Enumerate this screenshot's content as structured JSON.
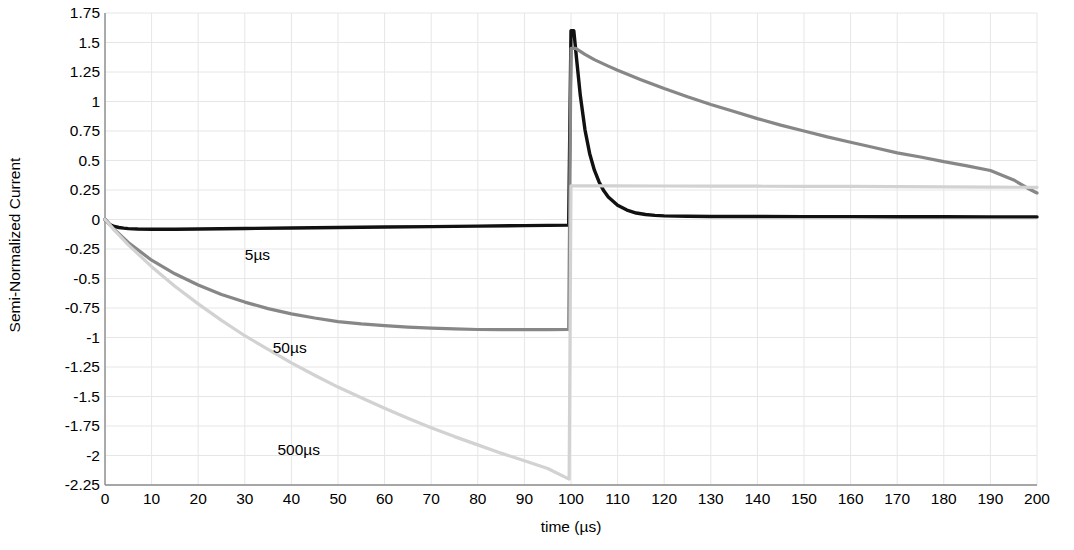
{
  "chart_data": {
    "type": "line",
    "title": "",
    "xlabel": "time (µs)",
    "ylabel": "Semi-Normalized Current",
    "xlim": [
      0,
      200
    ],
    "ylim": [
      -2.25,
      1.75
    ],
    "xticks": [
      0,
      10,
      20,
      30,
      40,
      50,
      60,
      70,
      80,
      90,
      100,
      110,
      120,
      130,
      140,
      150,
      160,
      170,
      180,
      190,
      200
    ],
    "yticks": [
      1.75,
      1.5,
      1.25,
      1,
      0.75,
      0.5,
      0.25,
      0,
      -0.25,
      -0.5,
      -0.75,
      -1,
      -1.25,
      -1.5,
      -1.75,
      -2,
      -2.25
    ],
    "xtick_labels": [
      "0",
      "10",
      "20",
      "30",
      "40",
      "50",
      "60",
      "70",
      "80",
      "90",
      "100",
      "110",
      "120",
      "130",
      "140",
      "150",
      "160",
      "170",
      "180",
      "190",
      "200"
    ],
    "ytick_labels": [
      "1.75",
      "1.5",
      "1.25",
      "1",
      "0.75",
      "0.5",
      "0.25",
      "0",
      "-0.25",
      "-0.5",
      "-0.75",
      "-1",
      "-1.25",
      "-1.5",
      "-1.75",
      "-2",
      "-2.25"
    ],
    "grid": true,
    "grid_color": "#e6e6e6",
    "legend": "inline-annotations",
    "series": [
      {
        "name": "5µs",
        "color": "#111111",
        "width": 3.4,
        "label_x": 30,
        "label_y": -0.3,
        "points": [
          [
            0,
            0
          ],
          [
            1,
            -0.042
          ],
          [
            2,
            -0.059
          ],
          [
            3,
            -0.068
          ],
          [
            4,
            -0.073
          ],
          [
            5,
            -0.077
          ],
          [
            7,
            -0.081
          ],
          [
            10,
            -0.083
          ],
          [
            15,
            -0.082
          ],
          [
            20,
            -0.08
          ],
          [
            30,
            -0.076
          ],
          [
            40,
            -0.072
          ],
          [
            50,
            -0.068
          ],
          [
            60,
            -0.064
          ],
          [
            70,
            -0.06
          ],
          [
            80,
            -0.056
          ],
          [
            90,
            -0.052
          ],
          [
            95,
            -0.05
          ],
          [
            99.5,
            -0.048
          ],
          [
            100,
            1.6
          ],
          [
            100.6,
            1.6
          ],
          [
            101.2,
            1.36
          ],
          [
            102,
            1.05
          ],
          [
            103,
            0.76
          ],
          [
            104,
            0.56
          ],
          [
            105,
            0.42
          ],
          [
            106,
            0.32
          ],
          [
            107,
            0.245
          ],
          [
            108,
            0.19
          ],
          [
            110,
            0.12
          ],
          [
            112,
            0.08
          ],
          [
            114,
            0.055
          ],
          [
            116,
            0.042
          ],
          [
            118,
            0.035
          ],
          [
            120,
            0.031
          ],
          [
            125,
            0.027
          ],
          [
            130,
            0.026
          ],
          [
            140,
            0.025
          ],
          [
            150,
            0.024
          ],
          [
            160,
            0.024
          ],
          [
            170,
            0.023
          ],
          [
            180,
            0.023
          ],
          [
            190,
            0.022
          ],
          [
            200,
            0.022
          ]
        ]
      },
      {
        "name": "50µs",
        "color": "#878787",
        "width": 3.2,
        "label_x": 36,
        "label_y": -1.09,
        "points": [
          [
            0,
            0
          ],
          [
            2,
            -0.085
          ],
          [
            5,
            -0.195
          ],
          [
            10,
            -0.345
          ],
          [
            15,
            -0.46
          ],
          [
            20,
            -0.555
          ],
          [
            25,
            -0.635
          ],
          [
            30,
            -0.7
          ],
          [
            35,
            -0.755
          ],
          [
            40,
            -0.8
          ],
          [
            45,
            -0.835
          ],
          [
            50,
            -0.865
          ],
          [
            55,
            -0.885
          ],
          [
            60,
            -0.9
          ],
          [
            65,
            -0.912
          ],
          [
            70,
            -0.92
          ],
          [
            75,
            -0.927
          ],
          [
            80,
            -0.932
          ],
          [
            85,
            -0.934
          ],
          [
            90,
            -0.934
          ],
          [
            95,
            -0.933
          ],
          [
            99.5,
            -0.932
          ],
          [
            100,
            1.45
          ],
          [
            101,
            1.45
          ],
          [
            103,
            1.4
          ],
          [
            105,
            1.355
          ],
          [
            108,
            1.3
          ],
          [
            110,
            1.265
          ],
          [
            115,
            1.185
          ],
          [
            120,
            1.11
          ],
          [
            125,
            1.04
          ],
          [
            130,
            0.975
          ],
          [
            135,
            0.915
          ],
          [
            140,
            0.855
          ],
          [
            145,
            0.8
          ],
          [
            150,
            0.75
          ],
          [
            155,
            0.7
          ],
          [
            160,
            0.655
          ],
          [
            165,
            0.61
          ],
          [
            170,
            0.565
          ],
          [
            175,
            0.53
          ],
          [
            180,
            0.49
          ],
          [
            185,
            0.455
          ],
          [
            190,
            0.415
          ],
          [
            195,
            0.335
          ],
          [
            198,
            0.265
          ],
          [
            200,
            0.225
          ]
        ]
      },
      {
        "name": "500µs",
        "color": "#d2d2d2",
        "width": 3.2,
        "label_x": 37,
        "label_y": -1.95,
        "points": [
          [
            0,
            0
          ],
          [
            2,
            -0.09
          ],
          [
            5,
            -0.215
          ],
          [
            10,
            -0.4
          ],
          [
            15,
            -0.565
          ],
          [
            20,
            -0.715
          ],
          [
            25,
            -0.855
          ],
          [
            30,
            -0.985
          ],
          [
            35,
            -1.1
          ],
          [
            40,
            -1.215
          ],
          [
            45,
            -1.32
          ],
          [
            50,
            -1.42
          ],
          [
            55,
            -1.51
          ],
          [
            60,
            -1.6
          ],
          [
            65,
            -1.685
          ],
          [
            70,
            -1.765
          ],
          [
            75,
            -1.84
          ],
          [
            80,
            -1.91
          ],
          [
            85,
            -1.98
          ],
          [
            90,
            -2.045
          ],
          [
            95,
            -2.11
          ],
          [
            99.6,
            -2.2
          ],
          [
            100,
            0.285
          ],
          [
            105,
            0.285
          ],
          [
            110,
            0.285
          ],
          [
            120,
            0.284
          ],
          [
            130,
            0.283
          ],
          [
            140,
            0.282
          ],
          [
            150,
            0.281
          ],
          [
            160,
            0.28
          ],
          [
            170,
            0.279
          ],
          [
            180,
            0.277
          ],
          [
            190,
            0.275
          ],
          [
            200,
            0.272
          ]
        ]
      }
    ]
  },
  "plot": {
    "left": 105,
    "right": 1037,
    "top": 13,
    "bottom": 485,
    "axis_color": "#8c8c8c",
    "background": "#ffffff"
  }
}
